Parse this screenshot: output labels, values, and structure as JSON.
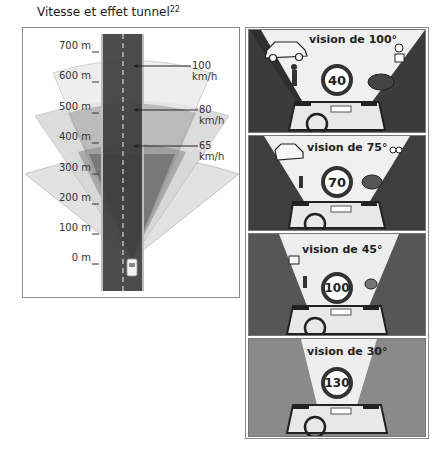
{
  "title": {
    "text": "Vitesse et effet tunnel",
    "footnote": "22"
  },
  "left_diagram": {
    "distance_labels": [
      "700 m",
      "600 m",
      "500 m",
      "400 m",
      "300 m",
      "200 m",
      "100 m",
      "0 m"
    ],
    "speed_labels": [
      "100 km/h",
      "80 km/h",
      "65 km/h"
    ],
    "colors": {
      "road": "#3a3a3a",
      "cone_light": "#d9d9d9",
      "cone_mid": "#a9a9a9",
      "cone_dark": "#6e6e6e"
    }
  },
  "panels": [
    {
      "vision_label": "vision de 100°",
      "sign_value": "40"
    },
    {
      "vision_label": "vision de 75°",
      "sign_value": "70"
    },
    {
      "vision_label": "vision de 45°",
      "sign_value": "100"
    },
    {
      "vision_label": "vision de 30°",
      "sign_value": "130"
    }
  ]
}
